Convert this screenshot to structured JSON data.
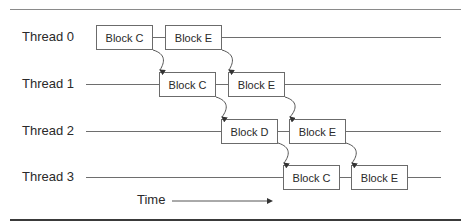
{
  "diagram": {
    "threads": [
      {
        "label": "Thread 0",
        "blocks": [
          {
            "label": "Block C"
          },
          {
            "label": "Block E"
          }
        ]
      },
      {
        "label": "Thread 1",
        "blocks": [
          {
            "label": "Block C"
          },
          {
            "label": "Block E"
          }
        ]
      },
      {
        "label": "Thread 2",
        "blocks": [
          {
            "label": "Block D"
          },
          {
            "label": "Block E"
          }
        ]
      },
      {
        "label": "Thread 3",
        "blocks": [
          {
            "label": "Block C"
          },
          {
            "label": "Block E"
          }
        ]
      }
    ],
    "time_axis": {
      "label": "Time"
    },
    "colors": {
      "line": "#6e6e6e",
      "box_border": "#6b6b6b",
      "text": "#2a2a2a",
      "bottom_rule": "#3a3a3a"
    }
  }
}
